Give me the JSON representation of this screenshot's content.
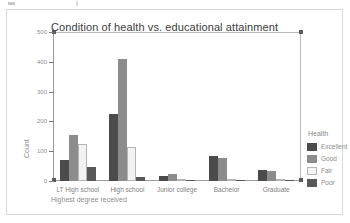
{
  "chart_data": {
    "type": "bar",
    "title": "Condition of health vs. educational attainment",
    "xlabel": "Highest degree received",
    "ylabel": "Count",
    "ylim": [
      0,
      500
    ],
    "yticks": [
      0,
      100,
      200,
      300,
      400,
      500
    ],
    "ytick_labels": [
      "0",
      "100",
      "200",
      "300",
      "400",
      "500"
    ],
    "grid": false,
    "legend_title": "Health",
    "legend_position": "right",
    "categories": [
      "LT High school",
      "High school",
      "Junior college",
      "Bachelor",
      "Graduate"
    ],
    "series": [
      {
        "name": "Excellent",
        "color": "#4b4b4b",
        "values": [
          70,
          225,
          18,
          85,
          38
        ]
      },
      {
        "name": "Good",
        "color": "#8c8c8c",
        "values": [
          155,
          408,
          25,
          78,
          32
        ]
      },
      {
        "name": "Fair",
        "color": "#f2f2f2",
        "values": [
          125,
          113,
          2,
          8,
          3
        ]
      },
      {
        "name": "Poor",
        "color": "#585858",
        "values": [
          48,
          15,
          1,
          3,
          1
        ]
      }
    ]
  },
  "legend": {
    "title": "Health",
    "items": [
      {
        "label": "Excellent",
        "swatch": "excellent"
      },
      {
        "label": "Good",
        "swatch": "good"
      },
      {
        "label": "Fair",
        "swatch": "fair"
      },
      {
        "label": "Poor",
        "swatch": "poor"
      }
    ]
  }
}
